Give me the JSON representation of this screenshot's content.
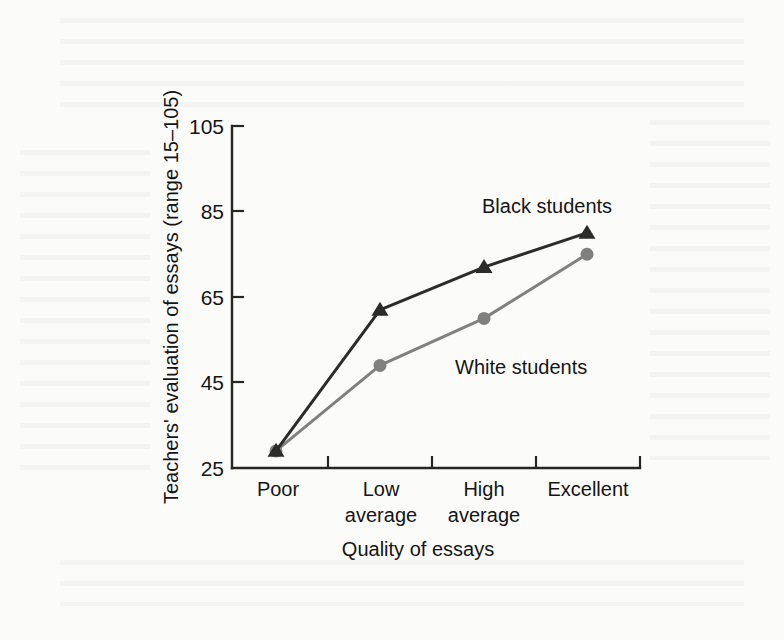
{
  "chart_data": {
    "type": "line",
    "title": "",
    "xlabel": "Quality of essays",
    "ylabel": "Teachers' evaluation of essays (range 15–105)",
    "categories": [
      "Poor",
      "Low average",
      "High average",
      "Excellent"
    ],
    "category_lines": [
      [
        "Poor"
      ],
      [
        "Low",
        "average"
      ],
      [
        "High",
        "average"
      ],
      [
        "Excellent"
      ]
    ],
    "ylim": [
      25,
      105
    ],
    "yticks": [
      25,
      45,
      65,
      85,
      105
    ],
    "ytick_labels": [
      "25",
      "45",
      "65",
      "85",
      "105"
    ],
    "grid": false,
    "legend_position": "inline-annotations",
    "series": [
      {
        "name": "Black students",
        "values": [
          29,
          62,
          72,
          80
        ],
        "color": "#2b2b2b",
        "marker": "triangle",
        "label_text": "Black students"
      },
      {
        "name": "White students",
        "values": [
          29,
          49,
          60,
          75
        ],
        "color": "#808080",
        "marker": "circle",
        "label_text": "White students"
      }
    ],
    "annotations": [
      {
        "text": "Black students",
        "series": "Black students"
      },
      {
        "text": "White students",
        "series": "White students"
      }
    ]
  },
  "axes": {
    "y_title": "Teachers' evaluation of essays (range 15–105)",
    "x_title": "Quality of essays",
    "y_tick_105": "105",
    "y_tick_85": "85",
    "y_tick_65": "65",
    "y_tick_45": "45",
    "y_tick_25": "25"
  },
  "x_categories": {
    "c0_line1": "Poor",
    "c1_line1": "Low",
    "c1_line2": "average",
    "c2_line1": "High",
    "c2_line2": "average",
    "c3_line1": "Excellent"
  },
  "labels": {
    "black_students": "Black students",
    "white_students": "White students"
  },
  "colors": {
    "black_series": "#2b2b2b",
    "white_series": "#808080",
    "axis": "#262626",
    "page_background": "#fbfbfa"
  }
}
